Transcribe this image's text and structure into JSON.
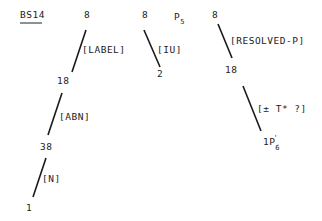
{
  "title": "BS14",
  "trees": [
    {
      "root": "8",
      "nodes": [
        "8",
        "18",
        "38",
        "1"
      ],
      "edges": [
        "[LABEL]",
        "[ABN]",
        "[N]"
      ]
    },
    {
      "root": "8",
      "nodes": [
        "8",
        "2"
      ],
      "edges": [
        "[IU]"
      ],
      "annotation": {
        "base": "P",
        "sub": "5"
      }
    },
    {
      "root": "8",
      "nodes": [
        "8",
        "18",
        "1P"
      ],
      "edges": [
        "[RESOLVED-P]",
        "[± T* ?]"
      ],
      "leaf_sub": "6",
      "leaf_prime": "'"
    }
  ],
  "colors": {
    "ink": "#222222",
    "background": "#ffffff"
  }
}
